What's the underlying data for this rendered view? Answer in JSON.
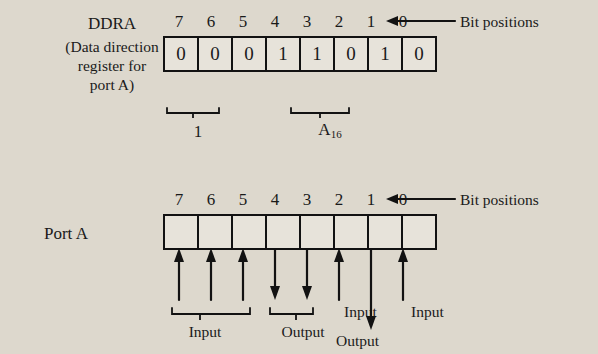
{
  "diagram": {
    "ddra": {
      "title": "DDRA",
      "caption_line1": "(Data direction",
      "caption_line2": "register for",
      "caption_line3": "port A)",
      "bit_positions": [
        "7",
        "6",
        "5",
        "4",
        "3",
        "2",
        "1",
        "0"
      ],
      "bit_positions_label": "Bit positions",
      "values": [
        "0",
        "0",
        "0",
        "1",
        "1",
        "0",
        "1",
        "0"
      ],
      "group_labels": {
        "high_nibble": "1",
        "low_nibble_text": "A",
        "low_nibble_sub": "16"
      }
    },
    "port": {
      "title": "Port A",
      "bit_positions": [
        "7",
        "6",
        "5",
        "4",
        "3",
        "2",
        "1",
        "0"
      ],
      "bit_positions_label": "Bit positions",
      "values": [
        "",
        "",
        "",
        "",
        "",
        "",
        "",
        ""
      ],
      "annotations": {
        "input_group": "Input",
        "output_group": "Output",
        "input_bit2": "Input",
        "input_bit0": "Input",
        "output_bit1": "Output"
      }
    }
  }
}
